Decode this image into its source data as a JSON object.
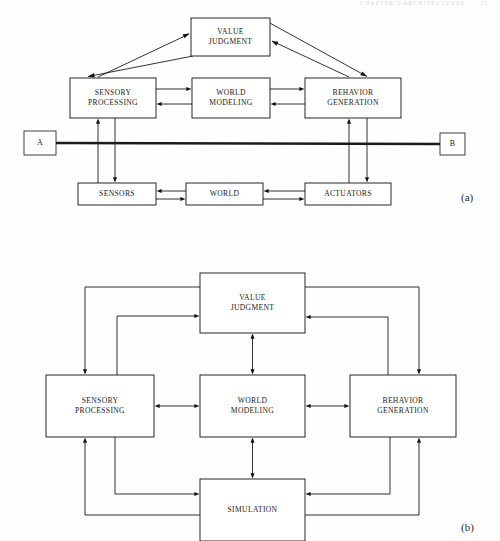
{
  "page": {
    "header_faint": "CHAPTER 2   ARCHITECTURES",
    "header_page_number": "25",
    "width": 500,
    "height": 541,
    "background_color": "#fefefe",
    "line_color": "#1b1b1b",
    "box_fill": "#ffffff"
  },
  "figure_a": {
    "caption": "(a)",
    "endpoint_left_label": "A",
    "endpoint_right_label": "B",
    "nodes": [
      {
        "id": "value_judgment",
        "label_lines": [
          "VALUE",
          "JUDGMENT"
        ],
        "x": 191,
        "y": 18,
        "w": 79,
        "h": 38
      },
      {
        "id": "sensory_processing",
        "label_lines": [
          "SENSORY",
          "PROCESSING"
        ],
        "x": 70,
        "y": 78,
        "w": 86,
        "h": 40
      },
      {
        "id": "world_modeling",
        "label_lines": [
          "WORLD",
          "MODELING"
        ],
        "x": 192,
        "y": 78,
        "w": 78,
        "h": 40
      },
      {
        "id": "behavior_generation",
        "label_lines": [
          "BEHAVIOR",
          "GENERATION"
        ],
        "x": 305,
        "y": 78,
        "w": 96,
        "h": 40
      },
      {
        "id": "sensors",
        "label_lines": [
          "SENSORS"
        ],
        "x": 78,
        "y": 183,
        "w": 78,
        "h": 22
      },
      {
        "id": "world",
        "label_lines": [
          "WORLD"
        ],
        "x": 186,
        "y": 183,
        "w": 77,
        "h": 22
      },
      {
        "id": "actuators",
        "label_lines": [
          "ACTUATORS"
        ],
        "x": 305,
        "y": 183,
        "w": 86,
        "h": 22
      },
      {
        "id": "endpoint_a",
        "label_lines": [
          "A"
        ],
        "x": 24,
        "y": 131,
        "w": 32,
        "h": 24
      },
      {
        "id": "endpoint_b",
        "label_lines": [
          "B"
        ],
        "x": 440,
        "y": 133,
        "w": 25,
        "h": 22
      }
    ],
    "edges": [
      "sensory-processing -> value-judgment",
      "value-judgment -> sensory-processing",
      "behavior-generation -> value-judgment",
      "value-judgment -> behavior-generation",
      "sensory-processing -> world-modeling",
      "world-modeling -> sensory-processing",
      "world-modeling -> behavior-generation",
      "behavior-generation -> world-modeling",
      "sensors -> sensory-processing",
      "sensory-processing -> sensors",
      "behavior-generation -> actuators",
      "actuators -> behavior-generation",
      "world -> sensors",
      "sensors -> world",
      "world -> actuators",
      "actuators -> world",
      "endpoint-a -- endpoint-b (thick bus line)"
    ]
  },
  "figure_b": {
    "caption": "(b)",
    "nodes": [
      {
        "id": "value_judgment",
        "label_lines": [
          "VALUE",
          "JUDGMENT"
        ],
        "x": 200,
        "y": 273,
        "w": 105,
        "h": 60
      },
      {
        "id": "sensory_processing",
        "label_lines": [
          "SENSORY",
          "PROCESSING"
        ],
        "x": 46,
        "y": 375,
        "w": 108,
        "h": 62
      },
      {
        "id": "world_modeling",
        "label_lines": [
          "WORLD",
          "MODELING"
        ],
        "x": 200,
        "y": 375,
        "w": 105,
        "h": 62
      },
      {
        "id": "behavior_generation",
        "label_lines": [
          "BEHAVIOR",
          "GENERATION"
        ],
        "x": 350,
        "y": 375,
        "w": 106,
        "h": 62
      },
      {
        "id": "simulation",
        "label_lines": [
          "SIMULATION"
        ],
        "x": 200,
        "y": 479,
        "w": 105,
        "h": 62
      }
    ],
    "edges": [
      "value-judgment <-> world-modeling",
      "sensory-processing <-> world-modeling",
      "world-modeling <-> behavior-generation",
      "world-modeling <-> simulation",
      "value-judgment -> sensory-processing (outer left)",
      "sensory-processing -> value-judgment (inner left)",
      "value-judgment -> behavior-generation (outer right)",
      "behavior-generation -> value-judgment (inner right)",
      "simulation -> sensory-processing (outer left lower)",
      "sensory-processing -> simulation (inner left lower)",
      "simulation -> behavior-generation (outer right lower)",
      "behavior-generation -> simulation (inner right lower)"
    ]
  }
}
